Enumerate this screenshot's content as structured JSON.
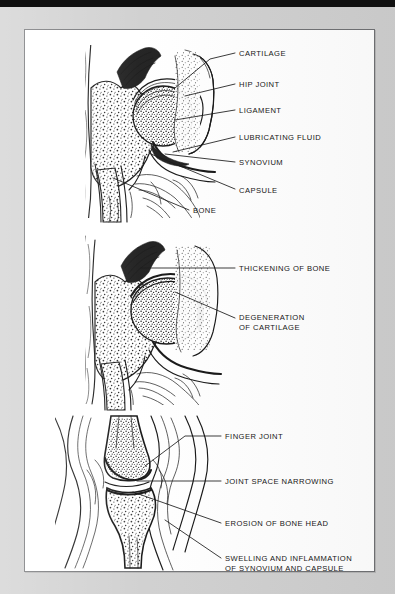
{
  "document": {
    "title": "Joint Anatomy and Arthritis Comparison Plate",
    "background_color": "#cfcfcf",
    "plate_color": "#ffffff",
    "ink_color": "#111111",
    "top_bar_color": "#101010"
  },
  "panels": [
    {
      "id": "panel-normal-hip",
      "name": "normal-hip-joint",
      "caption": "",
      "labels": [
        {
          "text": "CARTILAGE",
          "x": 214,
          "y": 26,
          "anchor": "start"
        },
        {
          "text": "HIP JOINT",
          "x": 214,
          "y": 57,
          "anchor": "start"
        },
        {
          "text": "LIGAMENT",
          "x": 214,
          "y": 83,
          "anchor": "start"
        },
        {
          "text": "LUBRICATING FLUID",
          "x": 214,
          "y": 110,
          "anchor": "start"
        },
        {
          "text": "SYNOVIUM",
          "x": 214,
          "y": 135,
          "anchor": "start"
        },
        {
          "text": "CAPSULE",
          "x": 214,
          "y": 163,
          "anchor": "start"
        },
        {
          "text": "BONE",
          "x": 168,
          "y": 183,
          "anchor": "start"
        }
      ]
    },
    {
      "id": "panel-osteoarthritis-hip",
      "name": "osteoarthritic-hip-joint",
      "caption": "",
      "labels": [
        {
          "text": "THICKENING OF BONE",
          "x": 214,
          "y": 241,
          "anchor": "start"
        },
        {
          "text": "DEGENERATION",
          "x": 214,
          "y": 290,
          "anchor": "start"
        },
        {
          "text": "OF CARTILAGE",
          "x": 214,
          "y": 300,
          "anchor": "start"
        }
      ]
    },
    {
      "id": "panel-rheumatoid-finger",
      "name": "rheumatoid-finger-joint",
      "caption": "",
      "labels": [
        {
          "text": "FINGER JOINT",
          "x": 200,
          "y": 409,
          "anchor": "start"
        },
        {
          "text": "JOINT SPACE NARROWING",
          "x": 200,
          "y": 454,
          "anchor": "start"
        },
        {
          "text": "EROSION OF BONE HEAD",
          "x": 200,
          "y": 496,
          "anchor": "start"
        },
        {
          "text": "SWELLING AND INFLAMMATION",
          "x": 200,
          "y": 531,
          "anchor": "start"
        },
        {
          "text": "OF SYNOVIUM AND CAPSULE",
          "x": 200,
          "y": 541,
          "anchor": "start"
        }
      ]
    }
  ],
  "icons": {
    "leader_line": "leader-line",
    "plate_border": "plate-border"
  }
}
